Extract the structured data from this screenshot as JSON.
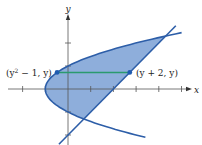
{
  "diagram": {
    "type": "region-between-curves",
    "curves": [
      {
        "name": "parabola",
        "equation": "x = y^2 - 1"
      },
      {
        "name": "line",
        "equation": "x = y + 2"
      }
    ],
    "intersections": [
      {
        "x": 4.3,
        "y": 2.3
      },
      {
        "x": 0.7,
        "y": -1.3
      }
    ],
    "axes": {
      "x_label": "x",
      "y_label": "y",
      "x_ticks": [
        -2,
        -1,
        1,
        2,
        3,
        4,
        5
      ],
      "y_ticks": [
        2,
        1,
        -1,
        -2
      ]
    },
    "segment": {
      "y_value": 0.72,
      "left_label_base": "(y",
      "left_label_sup": "2",
      "left_label_rest": " − 1, y)",
      "right_label": "(y + 2, y)"
    },
    "colors": {
      "fill": "#8eaedb",
      "curve": "#2d5ea8",
      "segment": "#2a9a6e",
      "point": "#1f5bb0",
      "axis": "#555555"
    }
  }
}
